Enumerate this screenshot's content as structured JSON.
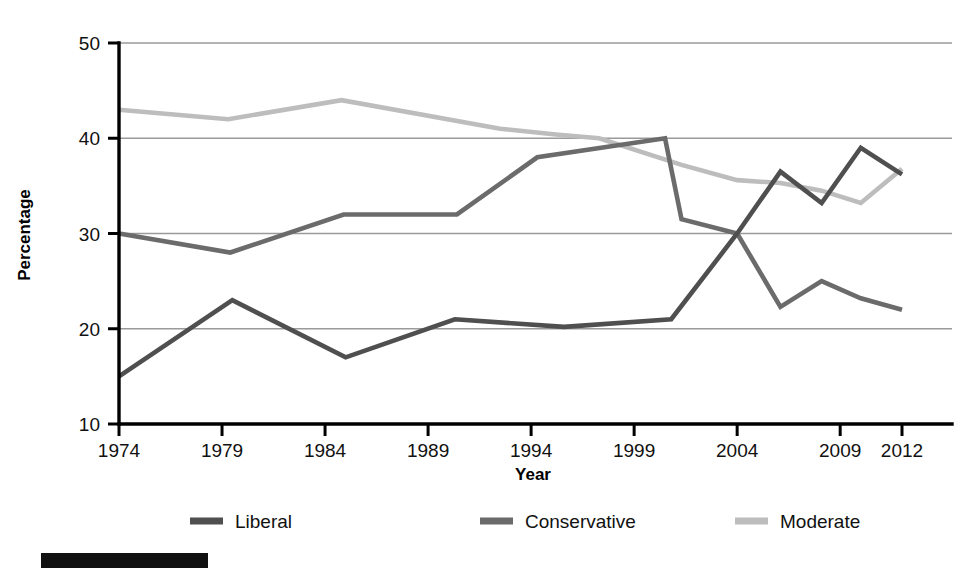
{
  "chart_data": {
    "type": "line",
    "title": "",
    "xlabel": "Year",
    "ylabel": "Percentage",
    "xlim": [
      1974,
      2012
    ],
    "ylim": [
      10,
      50
    ],
    "grid": true,
    "legend_position": "bottom",
    "xticks": [
      "1974",
      "1979",
      "1984",
      "1989",
      "1994",
      "1999",
      "2004",
      "2009",
      "2012"
    ],
    "xtick_values": [
      1974,
      1979,
      1984,
      1989,
      1994,
      1999,
      2004,
      2009,
      2012
    ],
    "yticks": [
      "10",
      "20",
      "30",
      "40",
      "50"
    ],
    "ytick_values": [
      10,
      20,
      30,
      40,
      50
    ],
    "series": [
      {
        "name": "Liberal",
        "color": "#4f4f4f",
        "points": [
          [
            1974,
            15
          ],
          [
            1979.5,
            23
          ],
          [
            1985,
            17
          ],
          [
            1990.3,
            21
          ],
          [
            1995.6,
            20.2
          ],
          [
            2000.8,
            21
          ],
          [
            2004,
            30
          ],
          [
            2006.1,
            36.5
          ],
          [
            2008.1,
            33.2
          ],
          [
            2010,
            39
          ],
          [
            2012,
            36.2
          ]
        ]
      },
      {
        "name": "Conservative",
        "color": "#6b6b6b",
        "points": [
          [
            1974,
            30
          ],
          [
            1979.4,
            28
          ],
          [
            1984.9,
            32
          ],
          [
            1990.4,
            32
          ],
          [
            1994.3,
            38
          ],
          [
            2000.5,
            40
          ],
          [
            2001.3,
            31.5
          ],
          [
            2004,
            30
          ],
          [
            2006.1,
            22.3
          ],
          [
            2008.1,
            25
          ],
          [
            2010,
            23.2
          ],
          [
            2012,
            22
          ]
        ]
      },
      {
        "name": "Moderate",
        "color": "#bdbdbd",
        "points": [
          [
            1974,
            43
          ],
          [
            1979.3,
            42
          ],
          [
            1984.8,
            44
          ],
          [
            1992.5,
            41
          ],
          [
            1995.2,
            40.4
          ],
          [
            1997.3,
            40
          ],
          [
            2001.3,
            37.2
          ],
          [
            2004,
            35.6
          ],
          [
            2006.1,
            35.3
          ],
          [
            2008.1,
            34.5
          ],
          [
            2010,
            33.2
          ],
          [
            2012,
            36.8
          ]
        ]
      }
    ]
  },
  "legend": {
    "items": [
      {
        "label": "Liberal",
        "color": "#4f4f4f"
      },
      {
        "label": "Conservative",
        "color": "#6b6b6b"
      },
      {
        "label": "Moderate",
        "color": "#bdbdbd"
      }
    ]
  }
}
